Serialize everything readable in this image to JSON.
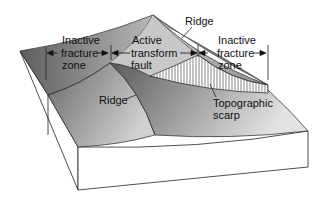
{
  "diagram": {
    "labels": {
      "inactive_left_1": "Inactive",
      "inactive_left_2": "fracture",
      "inactive_left_3": "zone",
      "active_1": "Active",
      "active_2": "transform",
      "active_3": "fault",
      "inactive_right_1": "Inactive",
      "inactive_right_2": "fracture",
      "inactive_right_3": "zone",
      "ridge_top": "Ridge",
      "ridge_bottom": "Ridge",
      "scarp_1": "Topographic",
      "scarp_2": "scarp"
    },
    "colors": {
      "background": "#ffffff",
      "dark_slope": "#6e6e6e",
      "mid_slope": "#9a9a9a",
      "light_slope": "#d6d6d6",
      "block_face": "#ffffff",
      "outline": "#222222"
    }
  }
}
